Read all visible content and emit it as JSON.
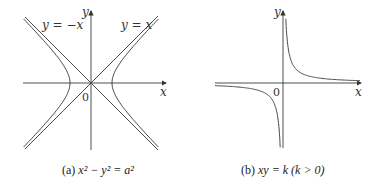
{
  "figure_a": {
    "axis_x_label": "x",
    "axis_y_label": "y",
    "origin_label": "0",
    "asymptote_left_label": "y = −x",
    "asymptote_right_label": "y = x",
    "caption_prefix": "(a) ",
    "caption_eq": "x² − y² = a²",
    "curve": "hyperbola x^2 - y^2 = a^2"
  },
  "figure_b": {
    "axis_x_label": "x",
    "axis_y_label": "y",
    "origin_label": "0",
    "caption_prefix": "(b) ",
    "caption_eq": "xy = k  (k > 0)",
    "curve": "hyperbola xy = k"
  }
}
